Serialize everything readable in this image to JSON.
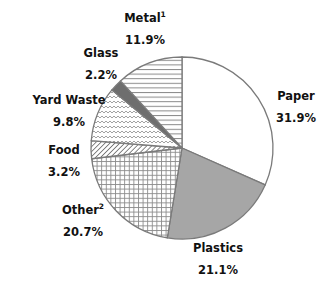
{
  "chart_data": {
    "type": "pie",
    "title": "",
    "start": "top",
    "direction": "clockwise",
    "slices": [
      {
        "label": "Paper",
        "superscript": "",
        "value": 31.9,
        "display": "31.9%",
        "pattern": "solid",
        "color": "#ffffff"
      },
      {
        "label": "Plastics",
        "superscript": "",
        "value": 21.1,
        "display": "21.1%",
        "pattern": "solid",
        "color": "#a6a6a6"
      },
      {
        "label": "Other",
        "superscript": "2",
        "value": 20.7,
        "display": "20.7%",
        "pattern": "grid",
        "color": "#ffffff"
      },
      {
        "label": "Food",
        "superscript": "",
        "value": 3.2,
        "display": "3.2%",
        "pattern": "diagonal",
        "color": "#ffffff"
      },
      {
        "label": "Yard Waste",
        "superscript": "",
        "value": 9.8,
        "display": "9.8%",
        "pattern": "wave",
        "color": "#ffffff"
      },
      {
        "label": "Glass",
        "superscript": "",
        "value": 2.2,
        "display": "2.2%",
        "pattern": "solid",
        "color": "#6e6e6e"
      },
      {
        "label": "Metal",
        "superscript": "1",
        "value": 11.9,
        "display": "11.9%",
        "pattern": "horizontal",
        "color": "#ffffff"
      }
    ],
    "stroke_color": "#7a7a7a",
    "pattern_color": "#8a8a8a"
  }
}
